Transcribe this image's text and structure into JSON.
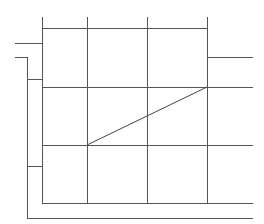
{
  "diagram": {
    "type": "line-drawing",
    "stroke_color": "#555555",
    "background": "#ffffff",
    "lines": [
      {
        "id": "v-grid-1",
        "x1": 42,
        "y1": 16,
        "x2": 42,
        "y2": 203
      },
      {
        "id": "v-grid-2",
        "x1": 87,
        "y1": 16,
        "x2": 87,
        "y2": 203
      },
      {
        "id": "v-grid-3",
        "x1": 147,
        "y1": 16,
        "x2": 147,
        "y2": 203
      },
      {
        "id": "v-grid-4",
        "x1": 207,
        "y1": 16,
        "x2": 207,
        "y2": 203
      },
      {
        "id": "h-grid-top",
        "x1": 42,
        "y1": 28,
        "x2": 207,
        "y2": 28
      },
      {
        "id": "h-right-stub",
        "x1": 207,
        "y1": 57,
        "x2": 252,
        "y2": 57
      },
      {
        "id": "h-grid-2",
        "x1": 42,
        "y1": 87,
        "x2": 252,
        "y2": 87
      },
      {
        "id": "h-grid-3",
        "x1": 42,
        "y1": 145,
        "x2": 252,
        "y2": 145
      },
      {
        "id": "h-grid-bottom",
        "x1": 42,
        "y1": 203,
        "x2": 252,
        "y2": 203
      },
      {
        "id": "h-bracket-top",
        "x1": 14,
        "y1": 43,
        "x2": 42,
        "y2": 43
      },
      {
        "id": "h-bracket-inner",
        "x1": 14,
        "y1": 57,
        "x2": 27,
        "y2": 57
      },
      {
        "id": "v-bracket",
        "x1": 27,
        "y1": 57,
        "x2": 27,
        "y2": 218
      },
      {
        "id": "h-bracket-link-1",
        "x1": 27,
        "y1": 79,
        "x2": 42,
        "y2": 79
      },
      {
        "id": "h-bracket-link-2",
        "x1": 27,
        "y1": 166,
        "x2": 42,
        "y2": 166
      },
      {
        "id": "h-outer-bottom",
        "x1": 27,
        "y1": 218,
        "x2": 252,
        "y2": 218
      }
    ],
    "diagonal": {
      "id": "diagonal",
      "x1": 87,
      "y1": 145,
      "x2": 207,
      "y2": 87
    }
  }
}
